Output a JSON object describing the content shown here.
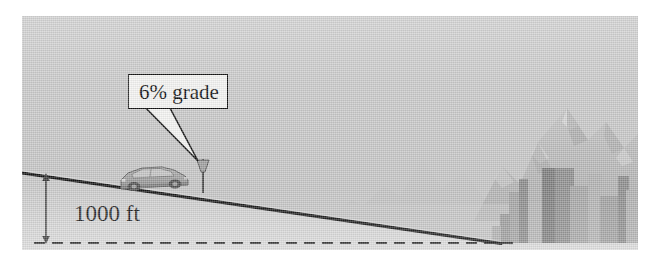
{
  "figure": {
    "kind": "physics-textbook-illustration",
    "caption_texts": {
      "grade_callout": "6% grade",
      "elevation": "1000 ft"
    },
    "colors": {
      "page_background": "#ffffff",
      "sky": "#c8c8c8",
      "ground": "#d2d2d2",
      "road_line": "#161616",
      "dashed_baseline": "#2a2a2a",
      "mountain_far": "#bdbdbd",
      "mountain_near": "#b0b0b0",
      "building_dark": "#8f8f8f",
      "building_mid": "#a3a3a3",
      "building_light": "#b4b4b4",
      "car_body": "#9a9a9a",
      "callout_fill": "#f4f4f2",
      "callout_stroke": "#121212",
      "text": "#1a1a1a"
    },
    "scene": {
      "road": {
        "name": "downhill-road",
        "grade_percent": 6,
        "start": {
          "x": 0,
          "y": 157
        },
        "end": {
          "x": 478,
          "y": 227
        }
      },
      "baseline": {
        "name": "horizontal-datum",
        "y": 227,
        "x_start": 12,
        "x_end": 492,
        "style": "dashed",
        "dash": "11 7"
      },
      "elevation_arrow": {
        "name": "elevation-dimension-arrow",
        "x": 24,
        "y_top": 158,
        "y_bottom": 227,
        "double_headed": true,
        "value_text": "1000 ft"
      },
      "callout": {
        "name": "grade-callout",
        "text": "6% grade",
        "box": {
          "x": 84,
          "y": 42,
          "w": 100,
          "h": 35
        },
        "tail_tip": {
          "x": 176,
          "y": 145
        }
      },
      "sign_post": {
        "name": "roadside-grade-sign",
        "x": 180,
        "y_top": 142,
        "y_bottom": 176
      },
      "car": {
        "name": "sedan-car",
        "x": 97,
        "y": 148,
        "width": 68,
        "height": 26,
        "facing": "left"
      },
      "mountains": [
        {
          "name": "mountain-far-left",
          "peak_x": 400,
          "peak_y": 143
        },
        {
          "name": "mountain-center",
          "peak_x": 452,
          "peak_y": 120
        },
        {
          "name": "mountain-main-peak",
          "peak_x": 545,
          "peak_y": 92
        },
        {
          "name": "mountain-right",
          "peak_x": 600,
          "peak_y": 110
        }
      ],
      "buildings": [
        {
          "name": "building-1",
          "x": 487,
          "y": 176,
          "w": 15,
          "h": 51,
          "shade": "mid"
        },
        {
          "name": "building-2",
          "x": 497,
          "y": 163,
          "w": 9,
          "h": 64,
          "shade": "dark"
        },
        {
          "name": "building-3",
          "x": 506,
          "y": 186,
          "w": 17,
          "h": 41,
          "shade": "light"
        },
        {
          "name": "building-4",
          "x": 520,
          "y": 152,
          "w": 32,
          "h": 75,
          "shade": "dark"
        },
        {
          "name": "building-5",
          "x": 548,
          "y": 170,
          "w": 22,
          "h": 57,
          "shade": "mid"
        },
        {
          "name": "building-6",
          "x": 566,
          "y": 158,
          "w": 14,
          "h": 69,
          "shade": "light"
        },
        {
          "name": "building-7",
          "x": 578,
          "y": 180,
          "w": 20,
          "h": 47,
          "shade": "mid"
        },
        {
          "name": "building-8",
          "x": 596,
          "y": 160,
          "w": 11,
          "h": 67,
          "shade": "dark"
        },
        {
          "name": "building-9",
          "x": 604,
          "y": 174,
          "w": 16,
          "h": 53,
          "shade": "light"
        }
      ]
    }
  }
}
